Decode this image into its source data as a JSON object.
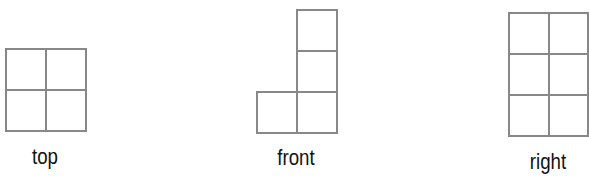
{
  "diagram": {
    "title": "",
    "line_color": "#888888",
    "views": [
      {
        "name": "top",
        "label": "top",
        "rows": 2,
        "cols": 2,
        "filled_cells": [
          [
            0,
            0
          ],
          [
            0,
            1
          ],
          [
            1,
            0
          ],
          [
            1,
            1
          ]
        ]
      },
      {
        "name": "front",
        "label": "front",
        "rows": 3,
        "cols": 2,
        "filled_cells": [
          [
            0,
            1
          ],
          [
            1,
            1
          ],
          [
            2,
            0
          ],
          [
            2,
            1
          ]
        ]
      },
      {
        "name": "right",
        "label": "right",
        "rows": 3,
        "cols": 2,
        "filled_cells": [
          [
            0,
            0
          ],
          [
            0,
            1
          ],
          [
            1,
            0
          ],
          [
            1,
            1
          ],
          [
            2,
            0
          ],
          [
            2,
            1
          ]
        ]
      }
    ]
  }
}
